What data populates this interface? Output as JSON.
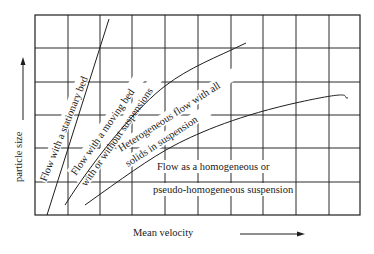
{
  "diagram": {
    "type": "flow-regime-map",
    "x_axis": {
      "label": "Mean velocity",
      "direction": "increasing-right"
    },
    "y_axis": {
      "label": "particle size",
      "direction": "increasing-up"
    },
    "grid": {
      "columns": 10,
      "rows": 6
    },
    "regions": [
      {
        "id": "stationary",
        "label": "Flow with a stationary bed"
      },
      {
        "id": "moving",
        "label_line1": "Flow with a moving bed",
        "label_line2": "with or without suspensions"
      },
      {
        "id": "heterogeneous",
        "label_line1": "Heterogeneous flow with all",
        "label_line2": "solids in suspension"
      },
      {
        "id": "homogeneous",
        "label_line1": "Flow as a homogeneous or",
        "label_line2": "pseudo-homogeneous suspension"
      }
    ],
    "boundaries": [
      {
        "id": "stationary-moving",
        "shape": "straight"
      },
      {
        "id": "moving-heterogeneous",
        "shape": "curved"
      },
      {
        "id": "heterogeneous-homogeneous",
        "shape": "curved"
      }
    ]
  }
}
